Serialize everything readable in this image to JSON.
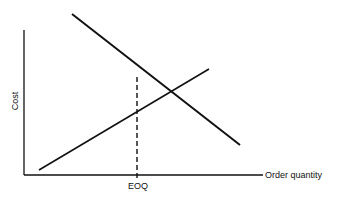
{
  "diagram": {
    "title": "",
    "y_axis_label": "Cost",
    "x_axis_label": "Order quantity",
    "marker_label": "EOQ",
    "lines": [
      {
        "name": "decreasing-cost-line",
        "description": "ordering cost (decreasing)",
        "x1": 72,
        "y1": 14,
        "x2": 240,
        "y2": 145
      },
      {
        "name": "increasing-cost-line",
        "description": "carrying cost (increasing)",
        "x1": 39,
        "y1": 170,
        "x2": 209,
        "y2": 69
      }
    ],
    "eoq_line": {
      "x": 137,
      "y_top": 77,
      "y_bottom": 175,
      "style": "dashed"
    },
    "colors": {
      "line": "#111111",
      "background": "#ffffff"
    }
  }
}
